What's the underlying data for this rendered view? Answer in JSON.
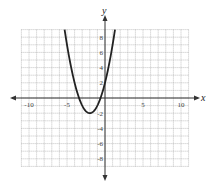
{
  "chart_data": {
    "type": "line",
    "title": "",
    "xlabel": "x",
    "ylabel": "y",
    "xlim": [
      -11,
      11
    ],
    "ylim": [
      -9,
      9
    ],
    "grid": true,
    "x_ticks": [
      {
        "value": -10,
        "label": "-10"
      },
      {
        "value": -5,
        "label": "-5"
      },
      {
        "value": 5,
        "label": "5"
      },
      {
        "value": 10,
        "label": "10"
      }
    ],
    "y_ticks": [
      {
        "value": 8,
        "label": "8"
      },
      {
        "value": 6,
        "label": "6"
      },
      {
        "value": 4,
        "label": "4"
      },
      {
        "value": 2,
        "label": "2"
      },
      {
        "value": -2,
        "label": "-2"
      },
      {
        "value": -4,
        "label": "-4"
      },
      {
        "value": -6,
        "label": "-6"
      },
      {
        "value": -8,
        "label": "-8"
      }
    ],
    "series": [
      {
        "name": "parabola",
        "function": "y = x^2 + 4x + 2",
        "vertex": [
          -2,
          -2
        ],
        "x": [
          -5.3,
          -5,
          -4,
          -3,
          -2,
          -1,
          0,
          1
        ],
        "y": [
          9,
          7,
          2,
          -1,
          -2,
          -1,
          2,
          7
        ]
      }
    ]
  }
}
